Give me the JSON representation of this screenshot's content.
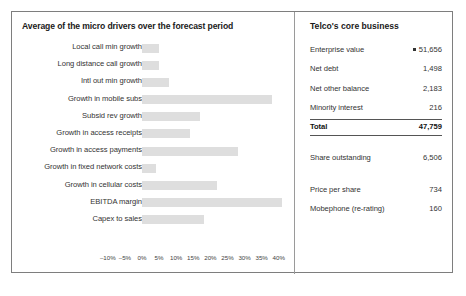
{
  "exhibit": {
    "left_panel": {
      "title": "Average of the micro drivers over the forecast period"
    },
    "right_panel": {
      "title": "Telco's core business"
    }
  },
  "chart_data": {
    "type": "bar",
    "orientation": "horizontal",
    "title": "Average of the micro drivers over the forecast period",
    "xlabel": "",
    "ylabel": "",
    "xlim": [
      -10,
      40
    ],
    "grid": false,
    "legend": null,
    "xticks": [
      "-10%",
      "-5%",
      "0%",
      "5%",
      "10%",
      "15%",
      "20%",
      "25%",
      "30%",
      "35%",
      "40%"
    ],
    "xtick_values": [
      -10,
      -5,
      0,
      5,
      10,
      15,
      20,
      25,
      30,
      35,
      40
    ],
    "bar_color": "#dedede",
    "categories": [
      "Local call min growth",
      "Long distance call growth",
      "Intl out min growth",
      "Growth in mobile subs",
      "Subsid rev growth",
      "Growth in access receipts",
      "Growth in access payments",
      "Growth in fixed network costs",
      "Growth in cellular costs",
      "EBITDA margin",
      "Capex to sales"
    ],
    "values": [
      5,
      5,
      8,
      38,
      17,
      14,
      28,
      4,
      22,
      41,
      18
    ]
  },
  "core_business": {
    "rows": [
      {
        "label": "Enterprise value",
        "value": "51,656",
        "bullet": true
      },
      {
        "label": "Net debt",
        "value": "1,498",
        "bullet": false
      },
      {
        "label": "Net other balance",
        "value": "2,183",
        "bullet": false
      },
      {
        "label": "Minority interest",
        "value": "216",
        "bullet": false
      },
      {
        "label": "Total",
        "value": "47,759",
        "bullet": false
      },
      {
        "label": "Share outstanding",
        "value": "6,506",
        "bullet": false
      },
      {
        "label": "Price per share",
        "value": "734",
        "bullet": false
      },
      {
        "label": "Mobephone (re-rating)",
        "value": "160",
        "bullet": false
      }
    ]
  }
}
